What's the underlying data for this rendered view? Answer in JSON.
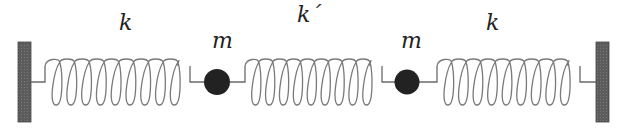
{
  "diagram": {
    "type": "coupled-oscillator",
    "labels": {
      "spring_left": "k",
      "mass_left": "m",
      "spring_middle": "k´",
      "mass_right": "m",
      "spring_right": "k"
    },
    "colors": {
      "wall": "#5a5a5a",
      "mass": "#222222",
      "spring": "#7a7a7a",
      "background": "#ffffff"
    }
  }
}
